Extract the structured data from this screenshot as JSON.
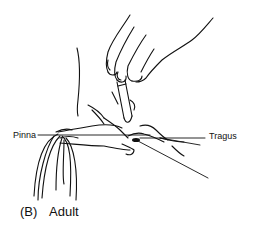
{
  "figure": {
    "caption_letter": "(B)",
    "caption_text": "Adult",
    "labels": {
      "pinna": "Pinna",
      "tragus": "Tragus",
      "ear_canal": "Ear Canal"
    },
    "line_color": "#111111",
    "background": "#ffffff"
  }
}
